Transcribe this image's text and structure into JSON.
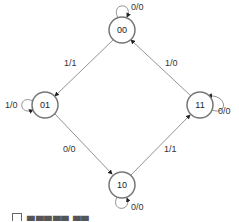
{
  "diagram": {
    "type": "state-machine",
    "colors": {
      "node_stroke": "#777777",
      "edge": "#666666",
      "text": "#333333"
    },
    "nodes": [
      {
        "id": "00",
        "label": "00",
        "cx": 122,
        "cy": 30
      },
      {
        "id": "01",
        "label": "01",
        "cx": 45,
        "cy": 105
      },
      {
        "id": "11",
        "label": "11",
        "cx": 200,
        "cy": 105
      },
      {
        "id": "10",
        "label": "10",
        "cx": 122,
        "cy": 185
      }
    ],
    "edges": [
      {
        "from": "00",
        "to": "00",
        "label": "0/0"
      },
      {
        "from": "00",
        "to": "01",
        "label": "1/1"
      },
      {
        "from": "01",
        "to": "01",
        "label": "1/0"
      },
      {
        "from": "01",
        "to": "10",
        "label": "0/0"
      },
      {
        "from": "10",
        "to": "10",
        "label": "0/0"
      },
      {
        "from": "10",
        "to": "11",
        "label": "1/1"
      },
      {
        "from": "11",
        "to": "11",
        "label": "0/0"
      },
      {
        "from": "11",
        "to": "00",
        "label": "1/0"
      }
    ]
  },
  "caption": {
    "text": "▆▆▆▆▆ ▆▆"
  }
}
